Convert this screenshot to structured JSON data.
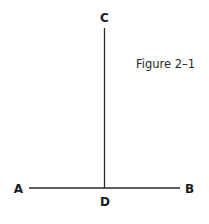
{
  "figure": {
    "caption": "Figure 2–1",
    "points": {
      "A": "A",
      "B": "B",
      "C": "C",
      "D": "D"
    },
    "segments": [
      {
        "name": "AB",
        "from": "A",
        "to": "B",
        "orientation": "horizontal"
      },
      {
        "name": "CD",
        "from": "C",
        "to": "D",
        "orientation": "vertical"
      }
    ]
  }
}
